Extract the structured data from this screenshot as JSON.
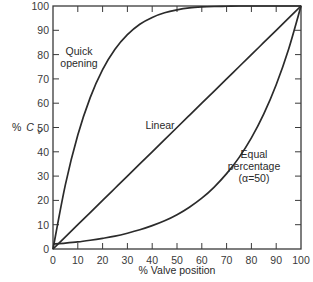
{
  "chart_data": {
    "type": "line",
    "title": "",
    "xlabel": "% Valve position",
    "ylabel": "% C_V",
    "xlim": [
      0,
      100
    ],
    "ylim": [
      0,
      100
    ],
    "grid": false,
    "x_ticks": [
      0,
      10,
      20,
      30,
      40,
      50,
      60,
      70,
      80,
      90,
      100
    ],
    "y_ticks": [
      0,
      10,
      20,
      30,
      40,
      50,
      60,
      70,
      80,
      90,
      100
    ],
    "x": [
      0,
      5,
      10,
      15,
      20,
      25,
      30,
      35,
      40,
      45,
      50,
      55,
      60,
      65,
      70,
      75,
      80,
      85,
      90,
      95,
      100
    ],
    "series": [
      {
        "name": "Quick opening",
        "values": [
          0,
          26.5,
          46.9,
          62.3,
          73.8,
          82.2,
          88.2,
          92.5,
          95.3,
          97.2,
          98.4,
          99.2,
          99.6,
          99.8,
          99.9,
          100,
          100,
          100,
          100,
          100,
          100
        ]
      },
      {
        "name": "Linear",
        "values": [
          0,
          5,
          10,
          15,
          20,
          25,
          30,
          35,
          40,
          45,
          50,
          55,
          60,
          65,
          70,
          75,
          80,
          85,
          90,
          95,
          100
        ]
      },
      {
        "name": "Equal percentage (α=50)",
        "values": [
          2.0,
          2.4,
          2.9,
          3.6,
          4.4,
          5.3,
          6.5,
          7.9,
          9.6,
          11.6,
          14.1,
          17.2,
          20.9,
          25.5,
          31.0,
          37.6,
          45.7,
          55.6,
          67.6,
          82.2,
          100
        ]
      }
    ],
    "annotations": [
      {
        "text": "Quick opening",
        "x": 11,
        "y": 80
      },
      {
        "text": "Linear",
        "x": 42,
        "y": 50
      },
      {
        "text": "Equal percentage (α=50)",
        "x": 85,
        "y": 32
      }
    ]
  },
  "labels": {
    "ylabel_prefix": "%",
    "ylabel_symbol": "C",
    "ylabel_sub": "V",
    "xlabel": "% Valve position",
    "quick_line1": "Quick",
    "quick_line2": "opening",
    "linear": "Linear",
    "eq_line1": "Equal",
    "eq_line2": "percentage",
    "eq_line3": "(α=50)"
  },
  "style": {
    "line_color": "#2b2b2b",
    "axis_color": "#3a3a3a"
  }
}
